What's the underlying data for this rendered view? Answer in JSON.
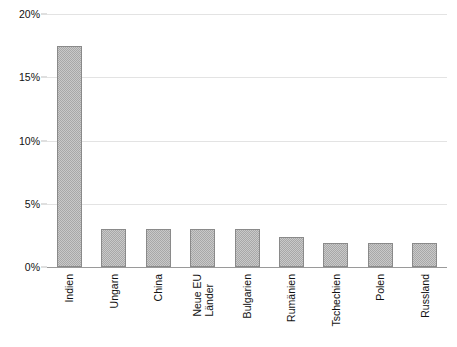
{
  "chart_data": {
    "type": "bar",
    "title": "",
    "subtitle": "",
    "xlabel": "",
    "ylabel": "",
    "categories": [
      "Indien",
      "Ungarn",
      "China",
      "Neue EU Länder",
      "Bulgarien",
      "Rumänien",
      "Tschechien",
      "Polen",
      "Russland"
    ],
    "category_lines": [
      [
        "Indien"
      ],
      [
        "Ungarn"
      ],
      [
        "China"
      ],
      [
        "Neue EU",
        "Länder"
      ],
      [
        "Bulgarien"
      ],
      [
        "Rumänien"
      ],
      [
        "Tschechien"
      ],
      [
        "Polen"
      ],
      [
        "Russland"
      ]
    ],
    "values": [
      17.5,
      3.0,
      3.0,
      3.0,
      3.0,
      2.4,
      1.9,
      1.9,
      1.9
    ],
    "value_unit": "%",
    "ylim": [
      0,
      20
    ],
    "yticks": [
      0,
      5,
      10,
      15,
      20
    ],
    "ytick_labels": [
      "0%",
      "5%",
      "10%",
      "15%",
      "20%"
    ],
    "grid": true,
    "grid_axis": "y",
    "legend": false,
    "legend_position": "none",
    "bar_fill_color": "#c9c9c9",
    "bar_pattern": "fine-dither-checker",
    "bar_border_color": "#8a8a8a",
    "grid_color": "#e3e3e3",
    "axis_color": "#9a9a9a",
    "text_color": "#111111",
    "background_color": "#ffffff",
    "xtick_label_rotation": 90
  }
}
